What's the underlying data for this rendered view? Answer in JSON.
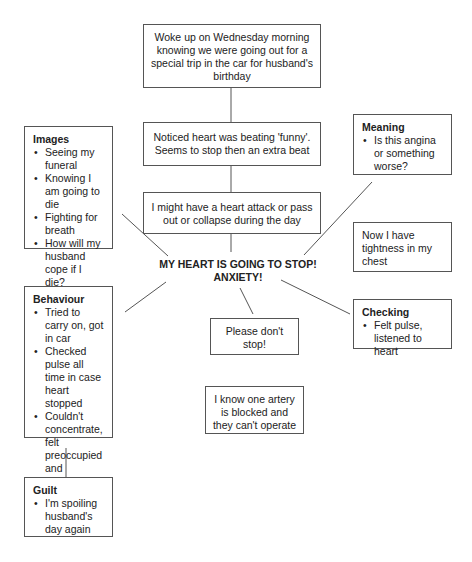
{
  "center": {
    "line1": "MY HEART IS GOING TO STOP!",
    "line2": "ANXIETY!"
  },
  "sequence": [
    "Woke up on Wednesday morning knowing we were going out for a special trip in the car for husband's birthday",
    "Noticed heart was beating 'funny'. Seems to stop then an extra beat",
    "I might have a heart attack or pass out or collapse during the day"
  ],
  "images": {
    "title": "Images",
    "items": [
      "Seeing my funeral",
      "Knowing I am going to die",
      "Fighting for breath",
      "How will my husband cope if I die?"
    ]
  },
  "meaning": {
    "title": "Meaning",
    "items": [
      "Is this angina or something worse?"
    ]
  },
  "tightness": "Now I have tightness in my chest",
  "behaviour": {
    "title": "Behaviour",
    "items": [
      "Tried to carry on, got in car",
      "Checked pulse all time in case heart stopped",
      "Couldn't concentrate, felt preoccupied and detached"
    ]
  },
  "checking": {
    "title": "Checking",
    "items": [
      "Felt pulse, listened to heart"
    ]
  },
  "please_dont_stop": "Please don't stop!",
  "artery": "I know one artery is blocked and they can't operate",
  "guilt": {
    "title": "Guilt",
    "items": [
      "I'm spoiling husband's day again"
    ]
  }
}
